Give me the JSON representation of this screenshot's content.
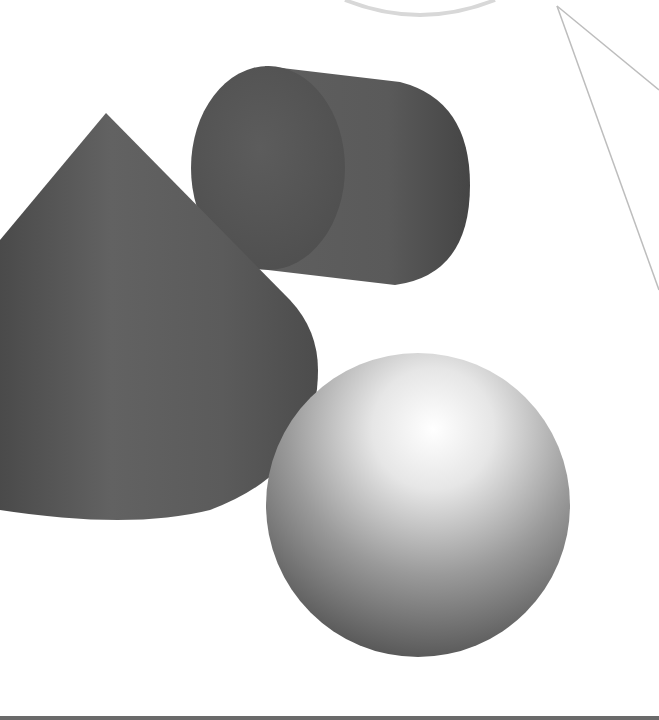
{
  "scene": {
    "description": "3D rendered geometric primitives: cone, cylinder, sphere",
    "background": "#ffffff",
    "shapes": [
      {
        "name": "cone",
        "color": "#5a5a5a"
      },
      {
        "name": "cylinder",
        "color": "#555555"
      },
      {
        "name": "sphere",
        "color": "#8a8a8a"
      }
    ]
  }
}
